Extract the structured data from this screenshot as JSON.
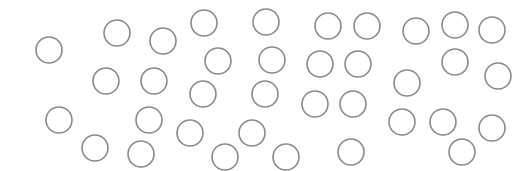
{
  "canvas": {
    "width": 531,
    "height": 171,
    "background": "#ffffff"
  },
  "style": {
    "stroke": "#8a8a8a",
    "stroke_width": 1.6,
    "radius": 13
  },
  "circles": [
    {
      "x": 49,
      "y": 50
    },
    {
      "x": 117,
      "y": 33
    },
    {
      "x": 163,
      "y": 41
    },
    {
      "x": 106,
      "y": 81
    },
    {
      "x": 154,
      "y": 81
    },
    {
      "x": 59,
      "y": 120
    },
    {
      "x": 149,
      "y": 120
    },
    {
      "x": 95,
      "y": 148
    },
    {
      "x": 141,
      "y": 154
    },
    {
      "x": 204,
      "y": 23
    },
    {
      "x": 266,
      "y": 22
    },
    {
      "x": 218,
      "y": 61
    },
    {
      "x": 272,
      "y": 60
    },
    {
      "x": 203,
      "y": 94
    },
    {
      "x": 265,
      "y": 94
    },
    {
      "x": 190,
      "y": 133
    },
    {
      "x": 252,
      "y": 133
    },
    {
      "x": 225,
      "y": 157
    },
    {
      "x": 286,
      "y": 157
    },
    {
      "x": 328,
      "y": 26
    },
    {
      "x": 367,
      "y": 26
    },
    {
      "x": 320,
      "y": 64
    },
    {
      "x": 358,
      "y": 64
    },
    {
      "x": 315,
      "y": 104
    },
    {
      "x": 353,
      "y": 104
    },
    {
      "x": 351,
      "y": 152
    },
    {
      "x": 416,
      "y": 31
    },
    {
      "x": 455,
      "y": 25
    },
    {
      "x": 492,
      "y": 30
    },
    {
      "x": 455,
      "y": 62
    },
    {
      "x": 498,
      "y": 76
    },
    {
      "x": 407,
      "y": 83
    },
    {
      "x": 402,
      "y": 122
    },
    {
      "x": 443,
      "y": 122
    },
    {
      "x": 492,
      "y": 128
    },
    {
      "x": 462,
      "y": 152
    }
  ]
}
